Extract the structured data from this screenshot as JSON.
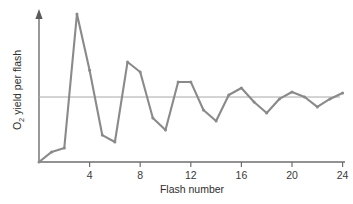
{
  "chart_data": {
    "type": "line",
    "title": "",
    "xlabel": "Flash number",
    "ylabel": "O2 yield per flash",
    "ylabel_parts": {
      "lead": "O",
      "subscript": "2",
      "trail": " yield per flash"
    },
    "x": [
      0,
      1,
      2,
      3,
      4,
      5,
      6,
      7,
      8,
      9,
      10,
      11,
      12,
      13,
      14,
      15,
      16,
      17,
      18,
      19,
      20,
      21,
      22,
      23,
      24
    ],
    "values": [
      0.0,
      0.068,
      0.095,
      1.0,
      0.62,
      0.182,
      0.135,
      0.676,
      0.608,
      0.297,
      0.216,
      0.541,
      0.541,
      0.351,
      0.277,
      0.453,
      0.5,
      0.405,
      0.331,
      0.426,
      0.473,
      0.439,
      0.372,
      0.426,
      0.466
    ],
    "series": [
      {
        "name": "O2 yield per flash",
        "values": [
          0.0,
          0.068,
          0.095,
          1.0,
          0.62,
          0.182,
          0.135,
          0.676,
          0.608,
          0.297,
          0.216,
          0.541,
          0.541,
          0.351,
          0.277,
          0.453,
          0.5,
          0.405,
          0.331,
          0.426,
          0.473,
          0.439,
          0.372,
          0.426,
          0.466
        ]
      }
    ],
    "xlim": [
      0,
      25.4
    ],
    "ylim": [
      0,
      1.0
    ],
    "xticks": [
      4,
      8,
      12,
      16,
      20,
      24
    ],
    "xticklabels": [
      "4",
      "8",
      "12",
      "16",
      "20",
      "24"
    ],
    "yticks": [],
    "yticklabels": [],
    "grid": false,
    "legend": false,
    "annotations": [
      {
        "name": "steady-state-reference-line",
        "type": "hline",
        "y": 0.439,
        "color": "#a9a9a9",
        "label": ""
      }
    ],
    "colors": {
      "line": "#8a8a8a",
      "marker": "#8a8a8a",
      "axis": "#6e6e6e",
      "reference": "#a9a9a9",
      "text": "#2e2e2e",
      "background": "#ffffff"
    },
    "marker": "circle",
    "yaxis_arrow": true
  }
}
